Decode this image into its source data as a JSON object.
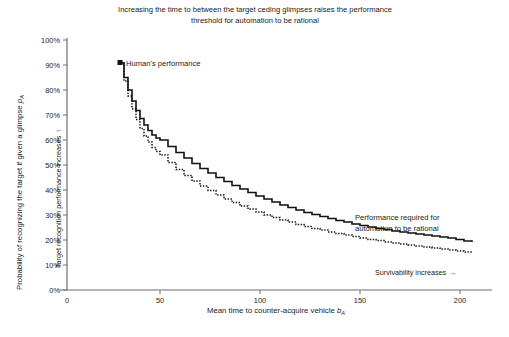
{
  "chart_data": {
    "type": "line",
    "title": "Increasing the time to between the target ceding glimpses raises the performance threshold for automation to be rational",
    "title_line1": "Increasing the time to between the target ceding glimpses raises the performance",
    "title_line2": "threshold for automation to be rational",
    "xlabel": "Mean time to counter-acquire vehicle b_A",
    "xlabel_main": "Mean time to counter-acquire vehicle ",
    "xlabel_var": "b",
    "xlabel_sub": "A",
    "ylabel": "Probability of recognizing the target if given a glimpse p_A",
    "ylabel_main": "Probability of recognizing the target if given a glimpse ",
    "ylabel_var": "p",
    "ylabel_sub": "A",
    "ylabel_secondary": "Target recognition performance increases",
    "ylabel_secondary_arrow": "↑",
    "xlim": [
      0,
      215
    ],
    "ylim": [
      0,
      100
    ],
    "xticks": [
      0,
      50,
      100,
      150,
      200
    ],
    "xticklabels": [
      "0",
      "50",
      "100",
      "150",
      "200"
    ],
    "yticks": [
      0,
      10,
      20,
      30,
      40,
      50,
      60,
      70,
      80,
      90,
      100
    ],
    "yticklabels": [
      "0%",
      "10%",
      "20%",
      "30%",
      "40%",
      "50%",
      "60%",
      "70%",
      "80%",
      "90%",
      "100%"
    ],
    "grid": false,
    "legend_position": "none",
    "line_color": "#111111",
    "annotations": [
      {
        "name": "humans-performance",
        "text": "Human's performance",
        "x": 30,
        "y": 91,
        "marker": "square"
      },
      {
        "name": "performance-required",
        "text_line1": "Performance required for",
        "text_line2": "automation to be rational",
        "x": 135,
        "y": 29
      },
      {
        "name": "survivability-increases",
        "text": "Survivability increases",
        "arrow": "→",
        "x": 145,
        "y": 9
      }
    ],
    "series": [
      {
        "name": "Performance required for automation to be rational",
        "style": "solid",
        "color": "#111111",
        "x": [
          30,
          32,
          34,
          36,
          38,
          40,
          42,
          44,
          46,
          48,
          50,
          54,
          58,
          62,
          66,
          70,
          74,
          78,
          82,
          86,
          90,
          94,
          98,
          102,
          106,
          110,
          114,
          118,
          122,
          126,
          130,
          134,
          138,
          142,
          146,
          150,
          154,
          158,
          162,
          166,
          170,
          174,
          178,
          182,
          186,
          190,
          194,
          198,
          202,
          206
        ],
        "values": [
          90.8,
          85.0,
          80.0,
          75.6,
          71.8,
          68.6,
          66.0,
          63.8,
          62.0,
          60.8,
          60.0,
          57.4,
          55.0,
          52.8,
          50.6,
          48.6,
          46.8,
          45.0,
          43.4,
          41.8,
          40.4,
          39.0,
          37.6,
          36.4,
          35.2,
          34.0,
          33.0,
          32.0,
          31.0,
          30.2,
          29.4,
          28.6,
          27.8,
          27.2,
          26.4,
          25.8,
          25.2,
          24.6,
          24.2,
          23.6,
          23.2,
          22.8,
          22.4,
          22.0,
          21.6,
          21.2,
          20.8,
          20.2,
          19.6,
          19.2
        ]
      },
      {
        "name": "Lower bound curve",
        "style": "dotted",
        "color": "#111111",
        "x": [
          30,
          32,
          34,
          36,
          38,
          40,
          42,
          44,
          46,
          48,
          50,
          54,
          58,
          62,
          66,
          70,
          74,
          78,
          82,
          86,
          90,
          94,
          98,
          102,
          106,
          110,
          114,
          118,
          122,
          126,
          130,
          134,
          138,
          142,
          146,
          150,
          154,
          158,
          162,
          166,
          170,
          174,
          178,
          182,
          186,
          190,
          194,
          198,
          202,
          206
        ],
        "values": [
          90.8,
          83.6,
          77.6,
          72.4,
          68.2,
          64.6,
          61.6,
          59.2,
          57.0,
          55.4,
          54.0,
          51.0,
          48.2,
          45.8,
          43.6,
          41.6,
          39.8,
          38.0,
          36.4,
          35.0,
          33.6,
          32.4,
          31.2,
          30.0,
          29.0,
          28.0,
          27.2,
          26.2,
          25.4,
          24.6,
          24.0,
          23.2,
          22.6,
          22.0,
          21.4,
          20.8,
          20.2,
          19.8,
          19.2,
          18.8,
          18.4,
          18.0,
          17.6,
          17.2,
          16.8,
          16.4,
          16.0,
          15.6,
          15.2,
          14.8
        ]
      }
    ]
  }
}
